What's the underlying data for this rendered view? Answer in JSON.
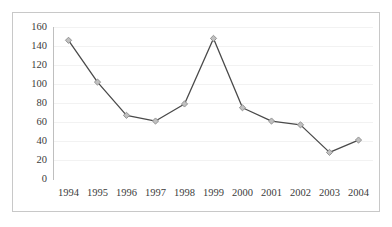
{
  "chart_data": {
    "type": "line",
    "title": "",
    "subtitle": "",
    "xlabel": "",
    "ylabel": "",
    "categories": [
      "1994",
      "1995",
      "1996",
      "1997",
      "1998",
      "1999",
      "2000",
      "2001",
      "2002",
      "2003",
      "2004"
    ],
    "series": [
      {
        "name": "",
        "values": [
          146,
          102,
          67,
          61,
          79,
          148,
          75,
          61,
          57,
          28,
          41
        ],
        "line_color": "#4a4a4a",
        "marker_color": "#c0c0c0",
        "marker_edge_color": "#8c8c8c",
        "marker_shape": "diamond"
      }
    ],
    "ylim": [
      0,
      160
    ],
    "yticks": [
      0,
      20,
      40,
      60,
      80,
      100,
      120,
      140,
      160
    ],
    "ytick_labels": [
      "0",
      "20",
      "40",
      "60",
      "80",
      "100",
      "120",
      "140",
      "160"
    ],
    "grid": true,
    "grid_axis": "y",
    "grid_color": "#f2f2f2",
    "legend": false,
    "legend_position": "none",
    "border_color": "#c8c8c8",
    "plot_background": "#ffffff",
    "tick_label_color": "#3b3b3b"
  }
}
